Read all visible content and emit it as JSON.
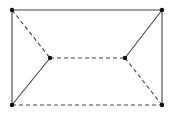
{
  "diagram": {
    "type": "graph",
    "colors": {
      "background": "#ffffff",
      "edge": "#444444",
      "vertex": "#111111"
    },
    "vertices": [
      {
        "id": "tl",
        "x": 12,
        "y": 10
      },
      {
        "id": "tr",
        "x": 162,
        "y": 10
      },
      {
        "id": "bl",
        "x": 12,
        "y": 105
      },
      {
        "id": "br",
        "x": 162,
        "y": 105
      },
      {
        "id": "il",
        "x": 50,
        "y": 58
      },
      {
        "id": "ir",
        "x": 125,
        "y": 58
      }
    ],
    "edges": [
      {
        "from": "tl",
        "to": "tr",
        "style": "solid"
      },
      {
        "from": "tl",
        "to": "bl",
        "style": "solid"
      },
      {
        "from": "tr",
        "to": "br",
        "style": "solid"
      },
      {
        "from": "bl",
        "to": "il",
        "style": "solid"
      },
      {
        "from": "tr",
        "to": "ir",
        "style": "solid"
      },
      {
        "from": "tl",
        "to": "il",
        "style": "dashed"
      },
      {
        "from": "il",
        "to": "ir",
        "style": "dashed"
      },
      {
        "from": "ir",
        "to": "br",
        "style": "dashed"
      },
      {
        "from": "bl",
        "to": "br",
        "style": "dashed"
      }
    ]
  }
}
